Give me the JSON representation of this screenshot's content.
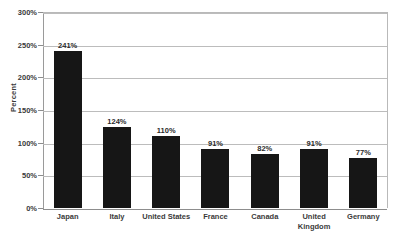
{
  "chart_data": {
    "type": "bar",
    "title": "",
    "xlabel": "",
    "ylabel": "Percent",
    "ylim": [
      0,
      300
    ],
    "ytick_labels": [
      "0%",
      "50%",
      "100%",
      "150%",
      "200%",
      "250%",
      "300%"
    ],
    "ytick_values": [
      0,
      50,
      100,
      150,
      200,
      250,
      300
    ],
    "grid": true,
    "legend": "none",
    "bar_color": "#161616",
    "gridline_color": "#bcbcbc",
    "categories": [
      "Japan",
      "Italy",
      "United States",
      "France",
      "Canada",
      "United Kingdom",
      "Germany"
    ],
    "category_lines": [
      [
        "Japan"
      ],
      [
        "Italy"
      ],
      [
        "United States"
      ],
      [
        "France"
      ],
      [
        "Canada"
      ],
      [
        "United",
        "Kingdom"
      ],
      [
        "Germany"
      ]
    ],
    "values": [
      241,
      124,
      110,
      91,
      82,
      91,
      77
    ],
    "value_labels": [
      "241%",
      "124%",
      "110%",
      "91%",
      "82%",
      "91%",
      "77%"
    ]
  }
}
